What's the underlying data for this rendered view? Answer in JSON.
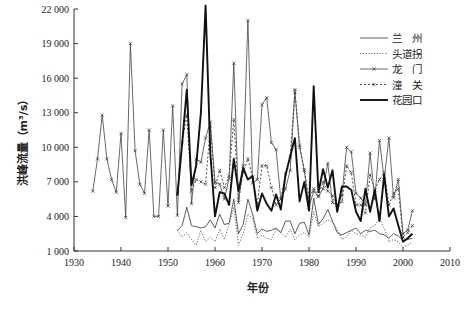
{
  "chart_data": {
    "type": "line",
    "title": "",
    "xlabel": "年份",
    "ylabel": "洪峰流量（m³/s）",
    "xlim": [
      1930,
      2010
    ],
    "ylim": [
      1000,
      22000
    ],
    "x_ticks": [
      "1930",
      "1940",
      "1950",
      "1960",
      "1970",
      "1980",
      "1990",
      "2000",
      "2010"
    ],
    "y_ticks": [
      "1 000",
      "4 000",
      "7 000",
      "10 000",
      "13 000",
      "16 000",
      "19 000",
      "22 000"
    ],
    "x_tick_values": [
      1930,
      1940,
      1950,
      1960,
      1970,
      1980,
      1990,
      2000,
      2010
    ],
    "y_tick_values": [
      1000,
      4000,
      7000,
      10000,
      13000,
      16000,
      19000,
      22000
    ],
    "grid": false,
    "legend_position": "top-right",
    "series": [
      {
        "name": "兰　州",
        "style": "thin-solid",
        "x": [
          1952,
          1953,
          1954,
          1955,
          1956,
          1957,
          1958,
          1959,
          1960,
          1961,
          1962,
          1963,
          1964,
          1965,
          1966,
          1967,
          1968,
          1969,
          1970,
          1971,
          1972,
          1973,
          1974,
          1975,
          1976,
          1977,
          1978,
          1979,
          1980,
          1981,
          1982,
          1983,
          1984,
          1985,
          1986,
          1987,
          1988,
          1989,
          1990,
          1991,
          1992,
          1993,
          1994,
          1995,
          1996,
          1997,
          1998,
          1999,
          2000,
          2001,
          2002
        ],
        "values": [
          2800,
          3200,
          4800,
          3200,
          3100,
          3000,
          3100,
          3700,
          3000,
          4200,
          3300,
          3400,
          5500,
          2500,
          3300,
          5500,
          4200,
          2500,
          2900,
          2700,
          2800,
          3000,
          2600,
          3600,
          3600,
          2500,
          3400,
          3500,
          2400,
          5600,
          3300,
          3800,
          4600,
          3600,
          2600,
          2400,
          2600,
          2800,
          3000,
          2500,
          2800,
          2700,
          2800,
          2500,
          2400,
          2100,
          2500,
          2300,
          1900,
          2000,
          2100
        ]
      },
      {
        "name": "头道拐",
        "style": "dotted",
        "x": [
          1952,
          1953,
          1954,
          1955,
          1956,
          1957,
          1958,
          1959,
          1960,
          1961,
          1962,
          1963,
          1964,
          1965,
          1966,
          1967,
          1968,
          1969,
          1970,
          1971,
          1972,
          1973,
          1974,
          1975,
          1976,
          1977,
          1978,
          1979,
          1980,
          1981,
          1982,
          1983,
          1984,
          1985,
          1986,
          1987,
          1988,
          1989,
          1990,
          1991,
          1992,
          1993,
          1994,
          1995,
          1996,
          1997,
          1998,
          1999,
          2000,
          2001,
          2002
        ],
        "values": [
          2800,
          2200,
          2600,
          2000,
          1500,
          2800,
          1800,
          2200,
          1800,
          2900,
          2000,
          3300,
          4800,
          1500,
          2500,
          4200,
          3800,
          2100,
          2400,
          2100,
          2000,
          2900,
          2600,
          2200,
          2900,
          2000,
          2400,
          2600,
          2200,
          4400,
          3100,
          3400,
          3700,
          3500,
          2900,
          2000,
          2200,
          2800,
          2500,
          2400,
          2200,
          3000,
          3200,
          3800,
          3000,
          1800,
          2000,
          1800,
          1300,
          1500,
          1800
        ]
      },
      {
        "name": "龙　门",
        "style": "thin-solid-marker",
        "x": [
          1934,
          1935,
          1936,
          1937,
          1938,
          1939,
          1940,
          1941,
          1942,
          1943,
          1944,
          1945,
          1946,
          1947,
          1948,
          1949,
          1950,
          1951,
          1952,
          1953,
          1954,
          1955,
          1956,
          1957,
          1958,
          1959,
          1960,
          1961,
          1962,
          1963,
          1964,
          1965,
          1966,
          1967,
          1968,
          1969,
          1970,
          1971,
          1972,
          1973,
          1974,
          1975,
          1976,
          1977,
          1978,
          1979,
          1980,
          1981,
          1982,
          1983,
          1984,
          1985,
          1986,
          1987,
          1988,
          1989,
          1990,
          1991,
          1992,
          1993,
          1994,
          1995,
          1996,
          1997,
          1998,
          1999,
          2000,
          2001,
          2002
        ],
        "values": [
          6200,
          9000,
          12800,
          9000,
          7200,
          6100,
          11200,
          3900,
          19000,
          9700,
          6800,
          6000,
          11500,
          4000,
          4000,
          11500,
          4900,
          13600,
          4100,
          15500,
          16300,
          5100,
          9000,
          8700,
          10800,
          12200,
          7000,
          6800,
          5500,
          7300,
          17300,
          5200,
          8400,
          21000,
          6900,
          7200,
          13700,
          14300,
          10400,
          9800,
          5500,
          6400,
          8000,
          14800,
          10000,
          8000,
          4800,
          6200,
          5700,
          6400,
          8600,
          5200,
          5000,
          5800,
          10000,
          9600,
          6000,
          5600,
          5000,
          9500,
          5500,
          10600,
          7200,
          10800,
          5600,
          7200,
          2500,
          2800,
          4500
        ]
      },
      {
        "name": "潼　关",
        "style": "dashed-marker",
        "x": [
          1952,
          1953,
          1954,
          1955,
          1956,
          1957,
          1958,
          1959,
          1960,
          1961,
          1962,
          1963,
          1964,
          1965,
          1966,
          1967,
          1968,
          1969,
          1970,
          1971,
          1972,
          1973,
          1974,
          1975,
          1976,
          1977,
          1978,
          1979,
          1980,
          1981,
          1982,
          1983,
          1984,
          1985,
          1986,
          1987,
          1988,
          1989,
          1990,
          1991,
          1992,
          1993,
          1994,
          1995,
          1996,
          1997,
          1998,
          1999,
          2000,
          2001,
          2002
        ],
        "values": [
          6000,
          10400,
          12800,
          6200,
          7200,
          7000,
          6800,
          11800,
          6500,
          8000,
          6500,
          7500,
          12400,
          5500,
          7800,
          9000,
          7400,
          5000,
          8400,
          8400,
          6500,
          5000,
          5500,
          7700,
          9200,
          15000,
          10200,
          8000,
          5600,
          6400,
          5800,
          7000,
          6200,
          5800,
          4700,
          5300,
          8400,
          7800,
          5000,
          5000,
          4300,
          7600,
          6300,
          7200,
          7800,
          5000,
          6000,
          6400,
          2200,
          2600,
          3200
        ]
      },
      {
        "name": "花园口",
        "style": "thick-solid",
        "x": [
          1952,
          1953,
          1954,
          1955,
          1956,
          1957,
          1958,
          1959,
          1960,
          1961,
          1962,
          1963,
          1964,
          1965,
          1966,
          1967,
          1968,
          1969,
          1970,
          1971,
          1972,
          1973,
          1974,
          1975,
          1976,
          1977,
          1978,
          1979,
          1980,
          1981,
          1982,
          1983,
          1984,
          1985,
          1986,
          1987,
          1988,
          1989,
          1990,
          1991,
          1992,
          1993,
          1994,
          1995,
          1996,
          1997,
          1998,
          1999,
          2000,
          2001,
          2002
        ],
        "values": [
          5800,
          10300,
          15000,
          6700,
          8400,
          13000,
          22300,
          9500,
          4000,
          6100,
          6000,
          5000,
          9000,
          6200,
          8200,
          7200,
          7500,
          4500,
          6000,
          5100,
          4500,
          5900,
          4600,
          7600,
          9200,
          10800,
          5300,
          7000,
          4500,
          15300,
          6100,
          8100,
          6500,
          8000,
          4400,
          6600,
          6600,
          6300,
          4400,
          3600,
          6400,
          4400,
          6300,
          3600,
          7600,
          4000,
          4700,
          3200,
          1800,
          2100,
          2500
        ]
      }
    ]
  },
  "legend": {
    "items": [
      "兰　州",
      "头道拐",
      "龙　门",
      "潼　关",
      "花园口"
    ]
  }
}
